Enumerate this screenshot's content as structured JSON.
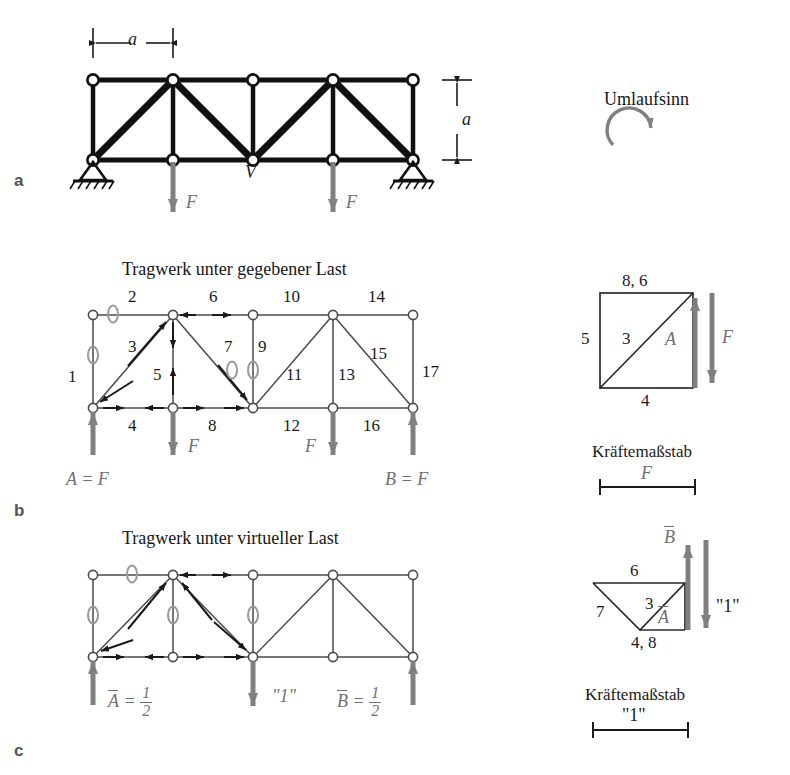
{
  "figure": {
    "panels": [
      {
        "letter": "a",
        "x": 14,
        "y": 172
      },
      {
        "letter": "b",
        "x": 14,
        "y": 502
      },
      {
        "letter": "c",
        "x": 14,
        "y": 742
      }
    ]
  },
  "panel_a": {
    "dim_horizontal": "a",
    "dim_vertical": "a",
    "node_label_V": "V",
    "loads": [
      {
        "label": "F",
        "x": 184,
        "y": 196
      },
      {
        "label": "F",
        "x": 338,
        "y": 196
      }
    ],
    "geometry": {
      "x0": 93,
      "dx": 80,
      "ytop": 80,
      "ybot": 160,
      "top_nodes": [
        93,
        173,
        253,
        333,
        413
      ],
      "bot_nodes": [
        93,
        173,
        253,
        333,
        413
      ],
      "diagonals": [
        [
          93,
          160,
          173,
          80
        ],
        [
          173,
          80,
          253,
          160
        ],
        [
          253,
          160,
          333,
          80
        ],
        [
          333,
          80,
          413,
          160
        ]
      ],
      "verticals": [
        [
          93
        ],
        [
          173
        ],
        [
          253
        ],
        [
          333
        ],
        [
          413
        ]
      ]
    }
  },
  "panel_b": {
    "title": "Tragwerk unter gegebener Last",
    "member_numbers": {
      "top_chord": [
        "2",
        "6",
        "10",
        "14"
      ],
      "left_vertical": "1",
      "right_vertical": "17",
      "diagonals": [
        "3",
        "7",
        "11",
        "15"
      ],
      "verticals": [
        "5",
        "9",
        "13"
      ],
      "bottom_chord": [
        "4",
        "8",
        "12",
        "16"
      ]
    },
    "zero_members": [
      "0",
      "0",
      "0",
      "0"
    ],
    "reaction_left": "A = F",
    "reaction_right": "B = F",
    "loads": [
      "F",
      "F"
    ],
    "force_polygon": {
      "labels": {
        "top": "8, 6",
        "left": "5",
        "diagonal": "3",
        "right_inner": "A",
        "bottom": "4",
        "external": "F"
      }
    },
    "scale": {
      "caption": "Kräftemaßstab",
      "value": "F"
    }
  },
  "panel_c": {
    "title": "Tragwerk unter virtueller Last",
    "zero_members": [
      "0",
      "0",
      "0",
      "0"
    ],
    "reaction_left": {
      "symbol": "A",
      "equals": "=",
      "numerator": "1",
      "denominator": "2"
    },
    "reaction_right": {
      "symbol": "B",
      "equals": "=",
      "numerator": "1",
      "denominator": "2"
    },
    "virtual_load": "\"1\"",
    "force_polygon": {
      "labels": {
        "top_reaction": "B",
        "top": "6",
        "left": "7",
        "diagonal": "3",
        "inner": "A",
        "bottom": "4, 8",
        "external": "\"1\""
      }
    },
    "scale": {
      "caption": "Kräftemaßstab",
      "value": "\"1\""
    }
  },
  "umlaufsinn": {
    "label": "Umlaufsinn",
    "direction": "clockwise"
  },
  "colors": {
    "ink": "#1a1a1a",
    "gray_force": "#808080",
    "gray_zero": "#8c8c8c",
    "panel_letter": "#555555"
  }
}
